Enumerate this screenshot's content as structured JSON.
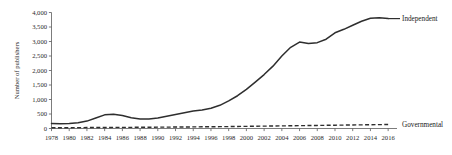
{
  "chart_data": {
    "type": "line",
    "title": "",
    "xlabel": "",
    "ylabel": "Number of publishers",
    "xlim": [
      1978,
      2017
    ],
    "ylim": [
      0,
      4000
    ],
    "grid": false,
    "legend_position": "right-inline",
    "x_tick_labels": [
      "1978",
      "1980",
      "1982",
      "1984",
      "1986",
      "1988",
      "1990",
      "1992",
      "1994",
      "1996",
      "1998",
      "2000",
      "2002",
      "2004",
      "2006",
      "2008",
      "2010",
      "2012",
      "2014",
      "2016"
    ],
    "y_tick_labels": [
      "0",
      "500",
      "1,000",
      "1,500",
      "2,000",
      "2,500",
      "3,000",
      "3,500",
      "4,000"
    ],
    "y_tick_values": [
      0,
      500,
      1000,
      1500,
      2000,
      2500,
      3000,
      3500,
      4000
    ],
    "x": [
      1978,
      1979,
      1980,
      1981,
      1982,
      1983,
      1984,
      1985,
      1986,
      1987,
      1988,
      1989,
      1990,
      1991,
      1992,
      1993,
      1994,
      1995,
      1996,
      1997,
      1998,
      1999,
      2000,
      2001,
      2002,
      2003,
      2004,
      2005,
      2006,
      2007,
      2008,
      2009,
      2010,
      2011,
      2012,
      2013,
      2014,
      2015,
      2016
    ],
    "series": [
      {
        "name": "Independent",
        "style": "solid",
        "color": "#2e2e2e",
        "values": [
          170,
          165,
          175,
          200,
          255,
          360,
          470,
          495,
          450,
          370,
          325,
          325,
          360,
          420,
          480,
          540,
          600,
          640,
          700,
          800,
          950,
          1130,
          1350,
          1600,
          1860,
          2150,
          2500,
          2800,
          2980,
          2930,
          2960,
          3080,
          3300,
          3420,
          3560,
          3700,
          3800,
          3820,
          3790
        ],
        "label_x": 2017,
        "label_y": 3820
      },
      {
        "name": "Governmental",
        "style": "dashed",
        "color": "#2e2e2e",
        "values": [
          25,
          26,
          28,
          30,
          32,
          34,
          36,
          38,
          40,
          40,
          42,
          44,
          46,
          48,
          50,
          52,
          55,
          58,
          60,
          63,
          66,
          70,
          74,
          78,
          82,
          86,
          90,
          94,
          98,
          102,
          106,
          110,
          114,
          118,
          122,
          126,
          130,
          134,
          138
        ],
        "label_x": 2017,
        "label_y": 138
      }
    ],
    "series_labels": {
      "independent": "Independent",
      "governmental": "Governmental"
    }
  }
}
